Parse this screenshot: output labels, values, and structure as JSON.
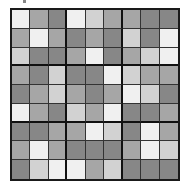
{
  "puzzle": {
    "rows": 9,
    "cols": 9,
    "box_size": 3,
    "palette": {
      "0": "#f0f0f0",
      "1": "#d2d2d2",
      "2": "#a6a6a6",
      "3": "#878787"
    },
    "grid": [
      [
        0,
        2,
        3,
        0,
        1,
        2,
        2,
        3,
        3
      ],
      [
        2,
        0,
        2,
        3,
        2,
        3,
        1,
        3,
        0
      ],
      [
        1,
        3,
        3,
        2,
        0,
        3,
        2,
        1,
        0
      ],
      [
        2,
        3,
        1,
        3,
        3,
        0,
        1,
        2,
        2
      ],
      [
        3,
        2,
        1,
        2,
        3,
        2,
        0,
        1,
        3
      ],
      [
        0,
        2,
        3,
        1,
        2,
        0,
        3,
        3,
        2
      ],
      [
        3,
        3,
        2,
        2,
        0,
        1,
        3,
        0,
        2
      ],
      [
        2,
        0,
        2,
        3,
        3,
        3,
        2,
        0,
        1
      ],
      [
        3,
        1,
        0,
        0,
        2,
        1,
        3,
        3,
        3
      ]
    ]
  }
}
